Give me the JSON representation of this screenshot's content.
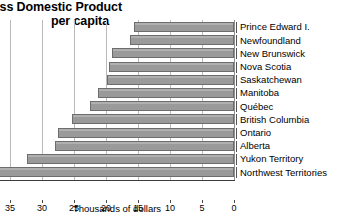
{
  "chart_data": {
    "type": "bar",
    "orientation": "horizontal",
    "title": "oss Domestic Product",
    "subtitle": "per capita",
    "xlabel": "Thousands of dollars",
    "ylabel": "",
    "xlim": [
      35,
      0
    ],
    "x_reversed": true,
    "grid": true,
    "legend": "none",
    "xticks": [
      35,
      30,
      25,
      20,
      15,
      10,
      5,
      0
    ],
    "xtick_labels": [
      "35",
      "30",
      "25",
      "20",
      "15",
      "10",
      "5",
      "0"
    ],
    "categories": [
      "Prince Edward I.",
      "Newfoundland",
      "New Brunswick",
      "Nova Scotia",
      "Saskatchewan",
      "Manitoba",
      "Québec",
      "British Columbia",
      "Ontario",
      "Alberta",
      "Yukon Territory",
      "Northwest Territories"
    ],
    "values": [
      15.6,
      16.3,
      19.0,
      19.6,
      19.8,
      21.3,
      22.5,
      25.3,
      27.5,
      28.0,
      32.3,
      36.6
    ],
    "units": "thousands of dollars",
    "note_clipped_bar": "Northwest Territories bar extends past the left edge of the visible plot area",
    "colors": {
      "bar_fill": "#9a9a9a",
      "bar_outline": "#6d6d6d",
      "gridline": "#b9b9b9",
      "axis": "#3d3d3d",
      "text": "#000000",
      "background": "#ffffff"
    }
  }
}
